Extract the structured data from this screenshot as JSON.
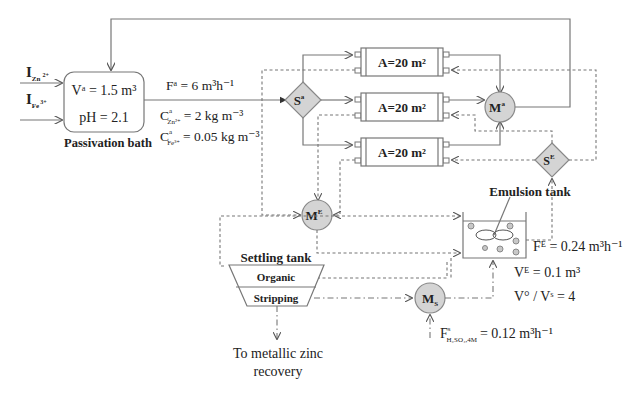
{
  "inputs": {
    "zn": {
      "main": "I",
      "sub": "Zn",
      "sup": "2+"
    },
    "fe": {
      "main": "I",
      "sub": "Fe",
      "sup": "3+"
    }
  },
  "passivation_bath": {
    "label": "Passivation bath",
    "volume": "Vᵃ = 1.5 m³",
    "ph": "pH = 2.1"
  },
  "feed": {
    "flow": "Fᵃ = 6 m³h⁻¹",
    "c_zn_main": "C",
    "c_zn_sup": "a",
    "c_zn_sub": "Zn²⁺",
    "c_zn_val": "= 2 kg m⁻³",
    "c_fe_main": "C",
    "c_fe_sup": "a",
    "c_fe_sub": "Fe³⁺",
    "c_fe_val": "= 0.05 kg m⁻³"
  },
  "nodes": {
    "splitter_a": {
      "main": "S",
      "sup": "a"
    },
    "mixer_a": {
      "main": "M",
      "sup": "a"
    },
    "splitter_e": {
      "main": "S",
      "sup": "E"
    },
    "mixer_e": {
      "main": "M",
      "sup": "E"
    },
    "mixer_s": {
      "main": "M",
      "sub": "S"
    }
  },
  "modules": [
    {
      "label": "A=20 m²"
    },
    {
      "label": "A=20 m²"
    },
    {
      "label": "A=20 m²"
    }
  ],
  "emulsion_tank": {
    "label": "Emulsion tank",
    "flow": "Fᴱ = 0.24 m³h⁻¹",
    "volume": "Vᴱ = 0.1 m³",
    "ratio": "V° / Vˢ = 4"
  },
  "settling_tank": {
    "label": "Settling tank",
    "organic": "Organic",
    "stripping": "Stripping"
  },
  "acid_feed": {
    "main": "F",
    "sup": "s",
    "sub": "H₂SO₄,4M",
    "val": "= 0.12 m³h⁻¹"
  },
  "outlet": {
    "line1": "To  metallic zinc",
    "line2": "recovery"
  },
  "colors": {
    "line": "#777777",
    "node_fill": "#d4d4d4",
    "text": "#222222"
  }
}
